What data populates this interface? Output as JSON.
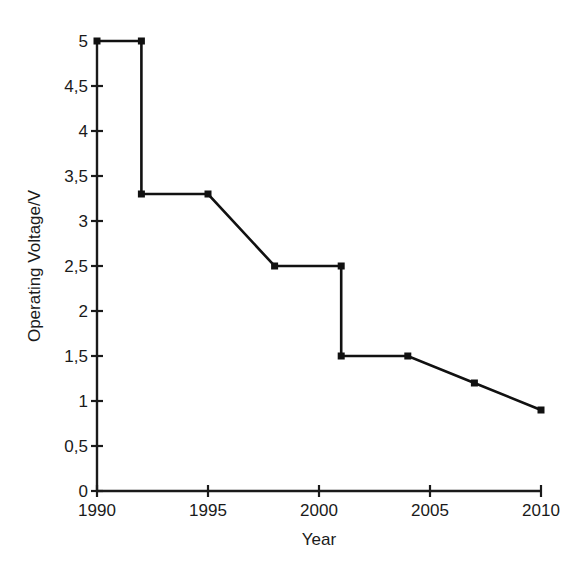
{
  "chart_data": {
    "type": "line",
    "title": "",
    "xlabel": "Year",
    "ylabel": "Operating Voltage/V",
    "xlim": [
      1990,
      2010
    ],
    "ylim": [
      0,
      5
    ],
    "grid": false,
    "legend": "none",
    "marker": "square",
    "line_color": "#111111",
    "x": [
      1990,
      1992,
      1992,
      1995,
      1998,
      2001,
      2001,
      2004,
      2007,
      2010
    ],
    "y": [
      5,
      5,
      3.3,
      3.3,
      2.5,
      2.5,
      1.5,
      1.5,
      1.2,
      0.9
    ],
    "points": [
      {
        "year": 1990,
        "voltage": 5
      },
      {
        "year": 1992,
        "voltage": 5
      },
      {
        "year": 1992,
        "voltage": 3.3
      },
      {
        "year": 1995,
        "voltage": 3.3
      },
      {
        "year": 1998,
        "voltage": 2.5
      },
      {
        "year": 2001,
        "voltage": 2.5
      },
      {
        "year": 2001,
        "voltage": 1.5
      },
      {
        "year": 2004,
        "voltage": 1.5
      },
      {
        "year": 2007,
        "voltage": 1.2
      },
      {
        "year": 2010,
        "voltage": 0.9
      }
    ],
    "xticks": [
      1990,
      1995,
      2000,
      2005,
      2010
    ],
    "xtick_labels": [
      "1990",
      "1995",
      "2000",
      "2005",
      "2010"
    ],
    "yticks": [
      0,
      0.5,
      1,
      1.5,
      2,
      2.5,
      3,
      3.5,
      4,
      4.5,
      5
    ],
    "ytick_labels": [
      "0",
      "0,5",
      "1",
      "1,5",
      "2",
      "2,5",
      "3",
      "3,5",
      "4",
      "4,5",
      "5"
    ]
  },
  "caption": {
    "text": ""
  }
}
